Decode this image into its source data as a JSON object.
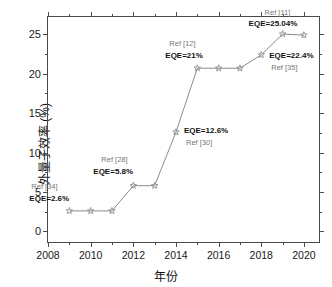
{
  "chart_data": {
    "type": "line",
    "title": "",
    "xlabel": "年份",
    "ylabel": "外量子效率 (%)",
    "xlim": [
      2008,
      2020.8
    ],
    "ylim": [
      -1.6,
      27.2
    ],
    "xticks": [
      2008,
      2010,
      2012,
      2014,
      2016,
      2018,
      2020
    ],
    "xtick_labels": [
      "2008",
      "2010",
      "2012",
      "2014",
      "2016",
      "2018",
      "2020"
    ],
    "yticks": [
      0,
      5,
      10,
      15,
      20,
      25
    ],
    "ytick_labels": [
      "0",
      "5",
      "10",
      "15",
      "20",
      "25"
    ],
    "grid": false,
    "legend": "none",
    "marker": "star",
    "series_color": "#8c8c8c",
    "x": [
      2009,
      2010,
      2011,
      2012,
      2013,
      2014,
      2015,
      2016,
      2017,
      2018,
      2019,
      2020
    ],
    "values": [
      2.6,
      2.6,
      2.6,
      5.8,
      5.8,
      12.6,
      20.7,
      20.7,
      20.7,
      22.4,
      25.04,
      24.9
    ],
    "series": [
      {
        "name": "外量子效率",
        "values": [
          2.6,
          2.6,
          2.6,
          5.8,
          5.8,
          12.6,
          20.7,
          20.7,
          20.7,
          22.4,
          25.04,
          24.9
        ]
      }
    ],
    "annotations": [
      {
        "ref": "Ref [34]",
        "eqe": "EQE=2.6%",
        "x": 2009,
        "y": 2.6
      },
      {
        "ref": "Ref [28]",
        "eqe": "EQE=5.8%",
        "x": 2012,
        "y": 5.8
      },
      {
        "ref": "Ref [30]",
        "eqe": "EQE=12.6%",
        "x": 2014,
        "y": 12.6
      },
      {
        "ref": "Ref [12]",
        "eqe": "EQE=21%",
        "x": 2015,
        "y": 20.7
      },
      {
        "ref": "Ref [35]",
        "eqe": "EQE=22.4%",
        "x": 2018,
        "y": 22.4
      },
      {
        "ref": "Ref [11]",
        "eqe": "EQE=25.04%",
        "x": 2019,
        "y": 25.04
      }
    ]
  },
  "axes": {
    "y_title": "外量子效率 (%)",
    "x_title": "年份",
    "y_tick_labels": [
      "0",
      "5",
      "10",
      "15",
      "20",
      "25"
    ],
    "x_tick_labels": [
      "2008",
      "2010",
      "2012",
      "2014",
      "2016",
      "2018",
      "2020"
    ]
  },
  "annotations": {
    "a1_ref": "Ref [34]",
    "a1_eqe": "EQE=2.6%",
    "a2_ref": "Ref [28]",
    "a2_eqe": "EQE=5.8%",
    "a3_ref": "Ref [30]",
    "a3_eqe": "EQE=12.6%",
    "a4_ref": "Ref [12]",
    "a4_eqe": "EQE=21%",
    "a5_ref": "Ref [35]",
    "a5_eqe": "EQE=22.4%",
    "a6_ref": "Ref [11]",
    "a6_eqe": "EQE=25.04%"
  },
  "colors": {
    "series": "#8c8c8c",
    "axis": "#4a4a4a",
    "text": "#111111",
    "ref_text": "#777777"
  }
}
